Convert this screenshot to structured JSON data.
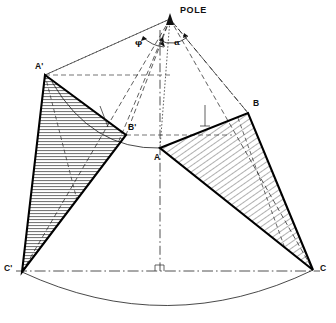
{
  "figure": {
    "kind": "geometry-construction-diagram",
    "background_color": "#ffffff",
    "ink_color": "#111111",
    "hatch_color": "#444444",
    "width": 336,
    "height": 323
  },
  "labels": {
    "pole": "POLE",
    "a_prime": "A'",
    "b_prime": "B'",
    "c_prime": "C'",
    "a": "A",
    "b": "B",
    "c": "C",
    "angle_phi": "φ",
    "angle_alpha": "α"
  },
  "points": {
    "pole": {
      "x": 170,
      "y": 17
    },
    "a_prime": {
      "x": 45,
      "y": 75
    },
    "b_prime": {
      "x": 126,
      "y": 135
    },
    "c_prime": {
      "x": 22,
      "y": 272
    },
    "a": {
      "x": 160,
      "y": 148
    },
    "b": {
      "x": 248,
      "y": 113
    },
    "c": {
      "x": 313,
      "y": 270
    }
  },
  "triangles": [
    {
      "name": "left-triangle-a-prime-b-prime-c-prime",
      "vertices": [
        "A'",
        "B'",
        "C'"
      ],
      "hatch": "horizontal",
      "fill": "#f2f2f2"
    },
    {
      "name": "right-triangle-a-b-c",
      "vertices": [
        "A",
        "B",
        "C"
      ],
      "hatch": "diagonal",
      "fill": "#eeeeee"
    }
  ],
  "construction_lines": [
    {
      "name": "pole-to-a-prime",
      "style": "dashed"
    },
    {
      "name": "pole-to-b-prime",
      "style": "dashed"
    },
    {
      "name": "pole-to-c-prime",
      "style": "dashed"
    },
    {
      "name": "pole-to-a",
      "style": "dotted"
    },
    {
      "name": "pole-to-b",
      "style": "dash-dot"
    },
    {
      "name": "pole-to-c",
      "style": "dashed"
    },
    {
      "name": "vertical-axis",
      "style": "dash-dot"
    },
    {
      "name": "chord-c-prime-to-c",
      "style": "dash-dot"
    },
    {
      "name": "base-arc",
      "style": "solid-thin"
    },
    {
      "name": "upper-arc-a-prime-to-a",
      "style": "solid-thin"
    }
  ],
  "angles": [
    {
      "name": "angle-phi",
      "label": "φ",
      "at": "pole"
    },
    {
      "name": "angle-alpha",
      "label": "α",
      "at": "pole"
    }
  ]
}
